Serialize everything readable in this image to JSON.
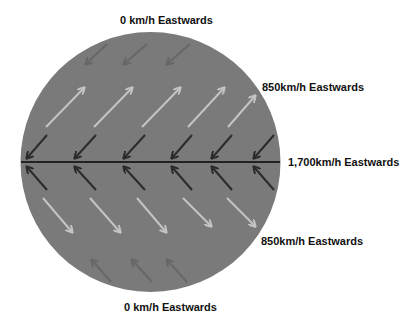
{
  "diagram": {
    "labels": {
      "top": "0 km/h Eastwards",
      "upper_mid": "850km/h Eastwards",
      "equator": "1,700km/h Eastwards",
      "lower_mid": "850km/h Eastwards",
      "bottom": "0 km/h Eastwards"
    },
    "colors": {
      "globe": "#7a7a7a",
      "equator_line": "#222222",
      "light_arrow": "#c4c4c4",
      "dark_arrow": "#2b2b2b",
      "faint_arrow": "#676767"
    },
    "arrow_rows": [
      {
        "name": "top-faint-row",
        "color_key": "faint_arrow",
        "arrows": [
          [
            107,
            44,
            86,
            64
          ],
          [
            147,
            44,
            124,
            64
          ],
          [
            190,
            44,
            167,
            64
          ]
        ]
      },
      {
        "name": "upper-light-row",
        "color_key": "light_arrow",
        "arrows": [
          [
            46,
            127,
            84,
            88
          ],
          [
            94,
            127,
            132,
            88
          ],
          [
            142,
            127,
            180,
            88
          ],
          [
            188,
            127,
            224,
            88
          ],
          [
            228,
            127,
            255,
            96
          ]
        ]
      },
      {
        "name": "upper-dark-row",
        "color_key": "dark_arrow",
        "arrows": [
          [
            47,
            135,
            27,
            158
          ],
          [
            96,
            135,
            75,
            158
          ],
          [
            145,
            135,
            124,
            158
          ],
          [
            192,
            135,
            172,
            158
          ],
          [
            232,
            135,
            212,
            158
          ],
          [
            274,
            135,
            254,
            158
          ]
        ]
      },
      {
        "name": "lower-dark-row",
        "color_key": "dark_arrow",
        "arrows": [
          [
            47,
            190,
            27,
            167
          ],
          [
            96,
            190,
            75,
            167
          ],
          [
            145,
            190,
            124,
            167
          ],
          [
            192,
            190,
            172,
            167
          ],
          [
            232,
            190,
            212,
            167
          ],
          [
            274,
            190,
            254,
            167
          ]
        ]
      },
      {
        "name": "lower-light-row",
        "color_key": "light_arrow",
        "arrows": [
          [
            43,
            198,
            72,
            232
          ],
          [
            90,
            198,
            120,
            232
          ],
          [
            137,
            198,
            166,
            232
          ],
          [
            183,
            198,
            211,
            226
          ],
          [
            227,
            198,
            255,
            226
          ]
        ]
      },
      {
        "name": "bottom-faint-row",
        "color_key": "faint_arrow",
        "arrows": [
          [
            111,
            282,
            92,
            260
          ],
          [
            152,
            282,
            132,
            260
          ],
          [
            187,
            282,
            167,
            260
          ]
        ]
      }
    ]
  }
}
